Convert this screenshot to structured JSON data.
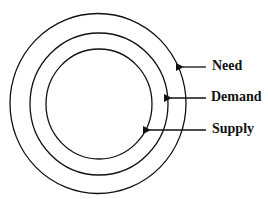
{
  "diagram": {
    "type": "concentric-circles",
    "labels": {
      "outer": "Need",
      "middle": "Demand",
      "inner": "Supply"
    },
    "stroke_color": "#111111",
    "background": "#ffffff"
  }
}
